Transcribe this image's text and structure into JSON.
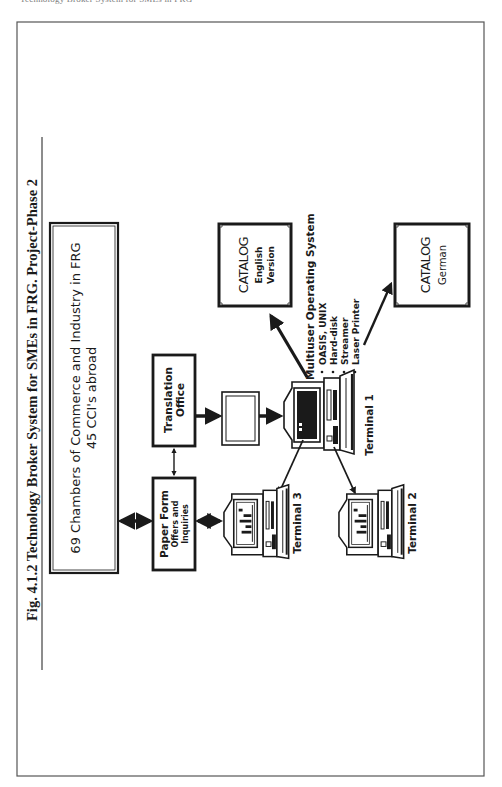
{
  "page": {
    "running_header_left": "Technology Broker System for SMEs in FRG",
    "running_header_right": ""
  },
  "figure": {
    "title": "Fig. 4.1.2 Technology Broker System for SMEs in FRG.  Project-Phase 2",
    "chambers_box": {
      "line1": "69 Chambers of Commerce and Industry in FRG",
      "line2": "45 CCI's abroad"
    },
    "paper_form_box": {
      "line1": "Paper Form",
      "line2": "Offers and",
      "line3": "Inquiries"
    },
    "translation_box": {
      "line1": "Translation",
      "line2": "Office"
    },
    "catalog_english": {
      "title": "CATALOG",
      "line2": "English",
      "line3": "Version"
    },
    "catalog_german": {
      "title": "CATALOG",
      "line2": "German"
    },
    "system_spec": {
      "heading": "Multiuser Operating System",
      "items": [
        "OASIS, UNIX",
        "Hard-disk",
        "Streamer",
        "Laser Printer"
      ]
    },
    "terminals": {
      "t1": "Terminal 1",
      "t2": "Terminal 2",
      "t3": "Terminal 3"
    },
    "colors": {
      "ink": "#1a1a1a",
      "frame": "#555555",
      "paper": "#ffffff"
    }
  }
}
